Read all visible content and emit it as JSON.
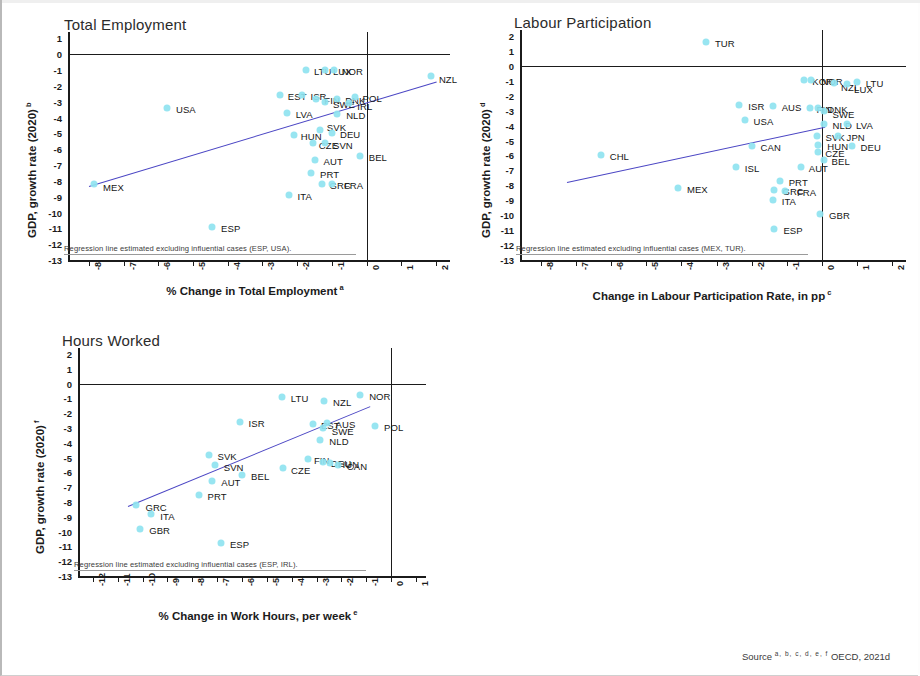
{
  "document": {
    "source_label": "Source",
    "source_marks": "a, b, c, d, e, f",
    "source_text": "OECD, 2021d"
  },
  "charts": [
    {
      "id": "total-employment",
      "chart_data": {
        "type": "scatter",
        "title": "Total Employment",
        "xlabel": "% Change in Total Employment",
        "xlabel_sup": "a",
        "ylabel": "GDP, growth rate (2020)",
        "ylabel_sup": "b",
        "xlim": [
          -8.6,
          2.4
        ],
        "ylim": [
          -13,
          1.4
        ],
        "xticks": [
          -8,
          -7,
          -6,
          -5,
          -4,
          -3,
          -2,
          -1,
          0,
          1,
          2
        ],
        "yticks": [
          1,
          0,
          -1,
          -2,
          -3,
          -4,
          -5,
          -6,
          -7,
          -8,
          -9,
          -10,
          -11,
          -12,
          -13
        ],
        "grid": false,
        "legend": "none",
        "note": "Regression line estimated excluding influential cases (ESP, USA).",
        "regression": {
          "x0": -8.0,
          "y0": -8.3,
          "x1": 2.0,
          "y1": -1.7
        },
        "points": [
          {
            "label": "LTU",
            "x": -1.75,
            "y": -1.0,
            "lx": 8,
            "ly": 0
          },
          {
            "label": "LUX",
            "x": -1.2,
            "y": -1.0,
            "lx": 8,
            "ly": 0
          },
          {
            "label": "NOR",
            "x": -0.95,
            "y": -1.0,
            "lx": 8,
            "ly": 0
          },
          {
            "label": "NZL",
            "x": 1.85,
            "y": -1.35,
            "lx": 8,
            "ly": 2
          },
          {
            "label": "EST",
            "x": -2.5,
            "y": -2.6,
            "lx": 8,
            "ly": 0
          },
          {
            "label": "ISR",
            "x": -1.85,
            "y": -2.6,
            "lx": 8,
            "ly": 0
          },
          {
            "label": "FIN",
            "x": -1.45,
            "y": -2.8,
            "lx": 8,
            "ly": 0
          },
          {
            "label": "SWE",
            "x": -1.2,
            "y": -3.0,
            "lx": 8,
            "ly": 1
          },
          {
            "label": "DNK",
            "x": -0.85,
            "y": -2.8,
            "lx": 8,
            "ly": 0
          },
          {
            "label": "POL",
            "x": -0.35,
            "y": -2.7,
            "lx": 8,
            "ly": 0
          },
          {
            "label": "IRL",
            "x": -0.5,
            "y": -3.1,
            "lx": 8,
            "ly": 2
          },
          {
            "label": "USA",
            "x": -5.75,
            "y": -3.4,
            "lx": 9,
            "ly": 0
          },
          {
            "label": "LVA",
            "x": -2.3,
            "y": -3.7,
            "lx": 9,
            "ly": 0
          },
          {
            "label": "NLD",
            "x": -0.85,
            "y": -3.8,
            "lx": 9,
            "ly": 0
          },
          {
            "label": "SVK",
            "x": -1.35,
            "y": -4.8,
            "lx": 7,
            "ly": -4
          },
          {
            "label": "HUN",
            "x": -2.1,
            "y": -5.1,
            "lx": 7,
            "ly": 0
          },
          {
            "label": "DEU",
            "x": -1.0,
            "y": -5.0,
            "lx": 8,
            "ly": 0
          },
          {
            "label": "CZE",
            "x": -1.55,
            "y": -5.6,
            "lx": 6,
            "ly": 1
          },
          {
            "label": "SVN",
            "x": -1.2,
            "y": -5.6,
            "lx": 8,
            "ly": 1
          },
          {
            "label": "BEL",
            "x": -0.2,
            "y": -6.4,
            "lx": 9,
            "ly": 0
          },
          {
            "label": "AUT",
            "x": -1.5,
            "y": -6.7,
            "lx": 9,
            "ly": 0
          },
          {
            "label": "PRT",
            "x": -1.6,
            "y": -7.5,
            "lx": 9,
            "ly": 0
          },
          {
            "label": "GRC",
            "x": -1.3,
            "y": -8.2,
            "lx": 8,
            "ly": 0
          },
          {
            "label": "FRA",
            "x": -1.0,
            "y": -8.2,
            "lx": 12,
            "ly": 0
          },
          {
            "label": "MEX",
            "x": -7.85,
            "y": -8.2,
            "lx": 9,
            "ly": 2
          },
          {
            "label": "ITA",
            "x": -2.25,
            "y": -8.9,
            "lx": 9,
            "ly": 0
          },
          {
            "label": "ESP",
            "x": -4.45,
            "y": -10.9,
            "lx": 9,
            "ly": 0
          }
        ]
      }
    },
    {
      "id": "labour-participation",
      "chart_data": {
        "type": "scatter",
        "title": "Labour Participation",
        "xlabel": "Change in Labour Participation Rate, in pp",
        "xlabel_sup": "c",
        "ylabel": "GDP, growth rate (2020)",
        "ylabel_sup": "d",
        "xlim": [
          -8.6,
          2.4
        ],
        "ylim": [
          -13,
          2.4
        ],
        "xticks": [
          -8,
          -7,
          -6,
          -5,
          -4,
          -3,
          -2,
          -1,
          0,
          1,
          2
        ],
        "yticks": [
          2,
          1,
          0,
          -1,
          -2,
          -3,
          -4,
          -5,
          -6,
          -7,
          -8,
          -9,
          -10,
          -11,
          -12,
          -13
        ],
        "grid": false,
        "legend": "none",
        "note": "Regression line estimated excluding influential cases (MEX, TUR).",
        "regression": {
          "x0": -7.25,
          "y0": -7.8,
          "x1": 0.1,
          "y1": -4.1
        },
        "points": [
          {
            "label": "TUR",
            "x": -3.3,
            "y": 1.6,
            "lx": 9,
            "ly": 0
          },
          {
            "label": "KOR",
            "x": -0.5,
            "y": -0.95,
            "lx": 8,
            "ly": 0
          },
          {
            "label": "NOR",
            "x": -0.3,
            "y": -0.95,
            "lx": 10,
            "ly": 0
          },
          {
            "label": "NZL",
            "x": 0.35,
            "y": -1.15,
            "lx": 7,
            "ly": 3
          },
          {
            "label": "LUX",
            "x": 0.72,
            "y": -1.2,
            "lx": 7,
            "ly": 4
          },
          {
            "label": "LTU",
            "x": 1.0,
            "y": -1.05,
            "lx": 9,
            "ly": 0
          },
          {
            "label": "ISR",
            "x": -2.35,
            "y": -2.65,
            "lx": 9,
            "ly": 0
          },
          {
            "label": "AUS",
            "x": -1.4,
            "y": -2.7,
            "lx": 9,
            "ly": 0
          },
          {
            "label": "FIN",
            "x": -0.35,
            "y": -2.8,
            "lx": 7,
            "ly": 0
          },
          {
            "label": "DNK",
            "x": -0.1,
            "y": -2.8,
            "lx": 9,
            "ly": 0
          },
          {
            "label": "SWE",
            "x": 0.05,
            "y": -3.0,
            "lx": 9,
            "ly": 2
          },
          {
            "label": "USA",
            "x": -2.2,
            "y": -3.6,
            "lx": 9,
            "ly": 0
          },
          {
            "label": "NLD",
            "x": 0.05,
            "y": -3.9,
            "lx": 9,
            "ly": 0
          },
          {
            "label": "LVA",
            "x": 0.72,
            "y": -3.9,
            "lx": 9,
            "ly": 0
          },
          {
            "label": "SVK",
            "x": -0.15,
            "y": -4.7,
            "lx": 9,
            "ly": 0
          },
          {
            "label": "JPN",
            "x": 0.45,
            "y": -4.7,
            "lx": 9,
            "ly": 0
          },
          {
            "label": "CHL",
            "x": -6.3,
            "y": -6.0,
            "lx": 9,
            "ly": 0
          },
          {
            "label": "CAN",
            "x": -2.0,
            "y": -5.4,
            "lx": 9,
            "ly": 0
          },
          {
            "label": "HUN",
            "x": -0.1,
            "y": -5.3,
            "lx": 9,
            "ly": 0
          },
          {
            "label": "DEU",
            "x": 0.85,
            "y": -5.4,
            "lx": 9,
            "ly": 0
          },
          {
            "label": "CZE",
            "x": -0.1,
            "y": -5.8,
            "lx": 7,
            "ly": 0
          },
          {
            "label": "BEL",
            "x": 0.05,
            "y": -6.3,
            "lx": 8,
            "ly": 0
          },
          {
            "label": "ISL",
            "x": -2.45,
            "y": -6.8,
            "lx": 9,
            "ly": 0
          },
          {
            "label": "AUT",
            "x": -0.6,
            "y": -6.8,
            "lx": 8,
            "ly": 0
          },
          {
            "label": "PRT",
            "x": -1.2,
            "y": -7.7,
            "lx": 9,
            "ly": 0
          },
          {
            "label": "MEX",
            "x": -4.1,
            "y": -8.2,
            "lx": 9,
            "ly": 0
          },
          {
            "label": "GRC",
            "x": -1.35,
            "y": -8.3,
            "lx": 8,
            "ly": 0
          },
          {
            "label": "FRA",
            "x": -1.05,
            "y": -8.4,
            "lx": 12,
            "ly": 0
          },
          {
            "label": "ITA",
            "x": -1.4,
            "y": -9.0,
            "lx": 9,
            "ly": 0
          },
          {
            "label": "GBR",
            "x": -0.05,
            "y": -9.9,
            "lx": 9,
            "ly": 0
          },
          {
            "label": "ESP",
            "x": -1.35,
            "y": -10.9,
            "lx": 9,
            "ly": 0
          }
        ]
      }
    },
    {
      "id": "hours-worked",
      "chart_data": {
        "type": "scatter",
        "title": "Hours Worked",
        "xlabel": "% Change in Work Hours, per week",
        "xlabel_sup": "e",
        "ylabel": "GDP, growth rate (2020)",
        "ylabel_sup": "f",
        "xlim": [
          -12.6,
          1.4
        ],
        "ylim": [
          -13,
          2.4
        ],
        "xticks": [
          -12,
          -11,
          -10,
          -9,
          -8,
          -7,
          -6,
          -5,
          -4,
          -3,
          -2,
          -1,
          0,
          1
        ],
        "yticks": [
          2,
          1,
          0,
          -1,
          -2,
          -3,
          -4,
          -5,
          -6,
          -7,
          -8,
          -9,
          -10,
          -11,
          -12,
          -13
        ],
        "grid": false,
        "legend": "none",
        "note": "Regression line estimated excluding influential cases (ESP, IRL).",
        "regression": {
          "x0": -10.6,
          "y0": -8.25,
          "x1": -0.85,
          "y1": -1.5
        },
        "points": [
          {
            "label": "LTU",
            "x": -4.4,
            "y": -0.9,
            "lx": 9,
            "ly": 0
          },
          {
            "label": "NZL",
            "x": -2.7,
            "y": -1.15,
            "lx": 9,
            "ly": 0
          },
          {
            "label": "NOR",
            "x": -1.25,
            "y": -0.75,
            "lx": 9,
            "ly": 0
          },
          {
            "label": "ISR",
            "x": -6.1,
            "y": -2.6,
            "lx": 9,
            "ly": 0
          },
          {
            "label": "EST",
            "x": -3.15,
            "y": -2.75,
            "lx": 8,
            "ly": 0
          },
          {
            "label": "AUS",
            "x": -2.6,
            "y": -2.65,
            "lx": 9,
            "ly": 0
          },
          {
            "label": "SWE",
            "x": -2.75,
            "y": -3.0,
            "lx": 9,
            "ly": 2
          },
          {
            "label": "POL",
            "x": -0.65,
            "y": -2.9,
            "lx": 9,
            "ly": 0
          },
          {
            "label": "NLD",
            "x": -2.85,
            "y": -3.8,
            "lx": 9,
            "ly": 0
          },
          {
            "label": "SVK",
            "x": -7.35,
            "y": -4.8,
            "lx": 9,
            "ly": 0
          },
          {
            "label": "FIN",
            "x": -3.35,
            "y": -5.1,
            "lx": 6,
            "ly": 0
          },
          {
            "label": "DEU",
            "x": -2.75,
            "y": -5.3,
            "lx": 8,
            "ly": 0
          },
          {
            "label": "HUN",
            "x": -2.45,
            "y": -5.4,
            "lx": 8,
            "ly": 0
          },
          {
            "label": "CAN",
            "x": -2.15,
            "y": -5.5,
            "lx": 9,
            "ly": 0
          },
          {
            "label": "SVN",
            "x": -7.1,
            "y": -5.5,
            "lx": 9,
            "ly": 1
          },
          {
            "label": "CZE",
            "x": -4.35,
            "y": -5.7,
            "lx": 8,
            "ly": 1
          },
          {
            "label": "BEL",
            "x": -6.0,
            "y": -6.2,
            "lx": 9,
            "ly": 0
          },
          {
            "label": "AUT",
            "x": -7.2,
            "y": -6.6,
            "lx": 9,
            "ly": 0
          },
          {
            "label": "PRT",
            "x": -7.75,
            "y": -7.5,
            "lx": 9,
            "ly": 0
          },
          {
            "label": "GRC",
            "x": -10.25,
            "y": -8.2,
            "lx": 9,
            "ly": 1
          },
          {
            "label": "ITA",
            "x": -9.65,
            "y": -8.8,
            "lx": 9,
            "ly": 1
          },
          {
            "label": "GBR",
            "x": -10.1,
            "y": -9.8,
            "lx": 9,
            "ly": 0
          },
          {
            "label": "ESP",
            "x": -6.85,
            "y": -10.8,
            "lx": 9,
            "ly": 0
          }
        ]
      }
    }
  ]
}
